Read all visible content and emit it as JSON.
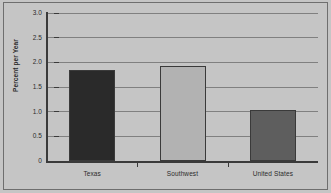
{
  "chart_data": {
    "type": "bar",
    "title": "",
    "subtitle": "",
    "xlabel": "",
    "ylabel": "Percent per Year",
    "categories": [
      "Texas",
      "Southwest",
      "United States"
    ],
    "values": [
      1.85,
      1.92,
      1.03
    ],
    "series": [
      {
        "name": "Percent per Year",
        "values": [
          1.85,
          1.92,
          1.03
        ]
      }
    ],
    "ylim": [
      0,
      3.0
    ],
    "ytick_values": [
      0,
      0.5,
      1.0,
      1.5,
      2.0,
      2.5,
      3.0
    ],
    "ytick_labels": [
      "0",
      "0.5",
      "1.0",
      "1.5",
      "2.0",
      "2.5",
      "3.0"
    ],
    "grid": true,
    "grid_axis": "y",
    "legend": false,
    "legend_position": "none",
    "bar_colors": [
      "#2a2a2a",
      "#b2b2b2",
      "#5e5e5e"
    ],
    "bar_edge_color": "#3a3a3a",
    "plot_background": "#c5c5c5",
    "gridline_color": "#808080",
    "axis_color": "#3a3a3a",
    "text_color": "#2b2b2b",
    "border_color": "#6e6e6e"
  }
}
